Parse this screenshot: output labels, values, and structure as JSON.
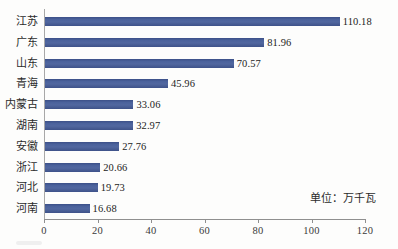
{
  "chart_data": {
    "type": "bar",
    "orientation": "horizontal",
    "title": "",
    "subtitle": "",
    "xlabel": "",
    "ylabel": "",
    "unit_note": "单位：万千瓦",
    "categories": [
      "江苏",
      "广东",
      "山东",
      "青海",
      "内蒙古",
      "湖南",
      "安徽",
      "浙江",
      "河北",
      "河南"
    ],
    "values": [
      110.18,
      81.96,
      70.57,
      45.96,
      33.06,
      32.97,
      27.76,
      20.66,
      19.73,
      16.68
    ],
    "value_labels": [
      "110.18",
      "81.96",
      "70.57",
      "45.96",
      "33.06",
      "32.97",
      "27.76",
      "20.66",
      "19.73",
      "16.68"
    ],
    "xlim": [
      0,
      120
    ],
    "xticks": [
      0,
      20,
      40,
      60,
      80,
      100,
      120
    ],
    "xtick_labels": [
      "0",
      "20",
      "40",
      "60",
      "80",
      "100",
      "120"
    ],
    "grid": false,
    "legend": "none",
    "series": [
      {
        "name": "装机容量",
        "color": "#47609a",
        "values": [
          110.18,
          81.96,
          70.57,
          45.96,
          33.06,
          32.97,
          27.76,
          20.66,
          19.73,
          16.68
        ]
      }
    ],
    "colors": {
      "bar": "#47609a",
      "bar_dark_edge": "#3c5088",
      "axis": "#8f8f8f",
      "text": "#2b2b2b",
      "background": "#fdfdfc"
    }
  },
  "rows": [
    {
      "label": "江苏",
      "value": 110.18,
      "value_label": "110.18"
    },
    {
      "label": "广东",
      "value": 81.96,
      "value_label": "81.96"
    },
    {
      "label": "山东",
      "value": 70.57,
      "value_label": "70.57"
    },
    {
      "label": "青海",
      "value": 45.96,
      "value_label": "45.96"
    },
    {
      "label": "内蒙古",
      "value": 33.06,
      "value_label": "33.06"
    },
    {
      "label": "湖南",
      "value": 32.97,
      "value_label": "32.97"
    },
    {
      "label": "安徽",
      "value": 27.76,
      "value_label": "27.76"
    },
    {
      "label": "浙江",
      "value": 20.66,
      "value_label": "20.66"
    },
    {
      "label": "河北",
      "value": 19.73,
      "value_label": "19.73"
    },
    {
      "label": "河南",
      "value": 16.68,
      "value_label": "16.68"
    }
  ],
  "axis": {
    "ticks": [
      {
        "value": 0,
        "label": "0"
      },
      {
        "value": 20,
        "label": "20"
      },
      {
        "value": 40,
        "label": "40"
      },
      {
        "value": 60,
        "label": "60"
      },
      {
        "value": 80,
        "label": "80"
      },
      {
        "value": 100,
        "label": "100"
      },
      {
        "value": 120,
        "label": "120"
      }
    ]
  },
  "annotation": {
    "unit": "单位：万千瓦"
  }
}
